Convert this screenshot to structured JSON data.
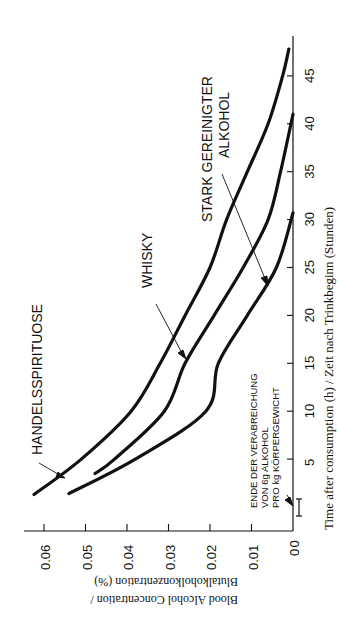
{
  "chart_data": {
    "type": "line",
    "orientation": "rotated-90-ccw",
    "title": "",
    "xlabel": "Time after consumption (h) / Zeit nach Trinkbeginn (Stunden)",
    "ylabel_line1": "Blood Alcohol Concentration /",
    "ylabel_line2": "Blutalkoholkonzentration (%)",
    "xlim": [
      0,
      48
    ],
    "ylim": [
      0,
      0.065
    ],
    "x_ticks": [
      0,
      5,
      10,
      15,
      20,
      25,
      30,
      35,
      40,
      45
    ],
    "x_tick_labels": [
      "5",
      "10",
      "15",
      "20",
      "25",
      "30",
      "35",
      "40",
      "45"
    ],
    "y_ticks": [
      0,
      0.01,
      0.02,
      0.03,
      0.04,
      0.05,
      0.06
    ],
    "y_tick_labels": [
      "0",
      "0.01",
      "0.02",
      "0.03",
      "0.04",
      "0.05",
      "0.06"
    ],
    "grid": false,
    "legend": "inline annotations with arrows",
    "series": [
      {
        "name": "HANDELSSPIRITUOSE",
        "points": [
          [
            1.3,
            0.0624
          ],
          [
            5,
            0.051
          ],
          [
            10,
            0.039
          ],
          [
            15,
            0.032
          ],
          [
            20,
            0.026
          ],
          [
            25,
            0.02
          ],
          [
            30,
            0.016
          ],
          [
            35,
            0.011
          ],
          [
            40,
            0.006
          ],
          [
            45,
            0.0025
          ],
          [
            47.8,
            0.001
          ]
        ]
      },
      {
        "name": "WHISKY",
        "points": [
          [
            3.5,
            0.0477
          ],
          [
            5,
            0.043
          ],
          [
            10,
            0.031
          ],
          [
            15,
            0.026
          ],
          [
            20,
            0.019
          ],
          [
            25,
            0.012
          ],
          [
            30,
            0.006
          ],
          [
            35,
            0.003
          ],
          [
            41,
            0.0
          ]
        ]
      },
      {
        "name": "STARK GEREINIGTER ALKOHOL",
        "points": [
          [
            1.4,
            0.054
          ],
          [
            5,
            0.038
          ],
          [
            10,
            0.021
          ],
          [
            15,
            0.018
          ],
          [
            20,
            0.011
          ],
          [
            25,
            0.004
          ],
          [
            30.7,
            0.0
          ]
        ]
      }
    ],
    "annotations": [
      {
        "text": "HANDELSSPIRITUOSE",
        "target_series": "HANDELSSPIRITUOSE"
      },
      {
        "text": "WHISKY",
        "target_series": "WHISKY"
      },
      {
        "text_line1": "STARK GEREINIGTER",
        "text_line2": "ALKOHOL",
        "target_series": "STARK GEREINIGTER ALKOHOL"
      },
      {
        "text_line1": "ENDE DER VERABREICHUNG",
        "text_line2": "VON 6g ALKOHOL",
        "text_line3": "PRO kg KÖRPERGEWICHT",
        "target": "end of administration marker at t≈1.3h"
      }
    ]
  },
  "labels": {
    "handels": "HANDELSSPIRITUOSE",
    "whisky": "WHISKY",
    "stark_1": "STARK GEREINIGTER",
    "stark_2": "ALKOHOL",
    "ende_1": "ENDE DER VERABREICHUNG",
    "ende_2": "VON 6g ALKOHOL",
    "ende_3": "PRO kg KÖRPERGEWICHT",
    "xlabel": "Time after consumption (h) / Zeit nach Trinkbeginn (Stunden)",
    "ylabel_1": "Blood Alcohol Concentration /",
    "ylabel_2": "Blutalkoholkonzentration (%)",
    "x0": "0"
  },
  "colors": {
    "ink": "#111111",
    "background": "#ffffff"
  }
}
